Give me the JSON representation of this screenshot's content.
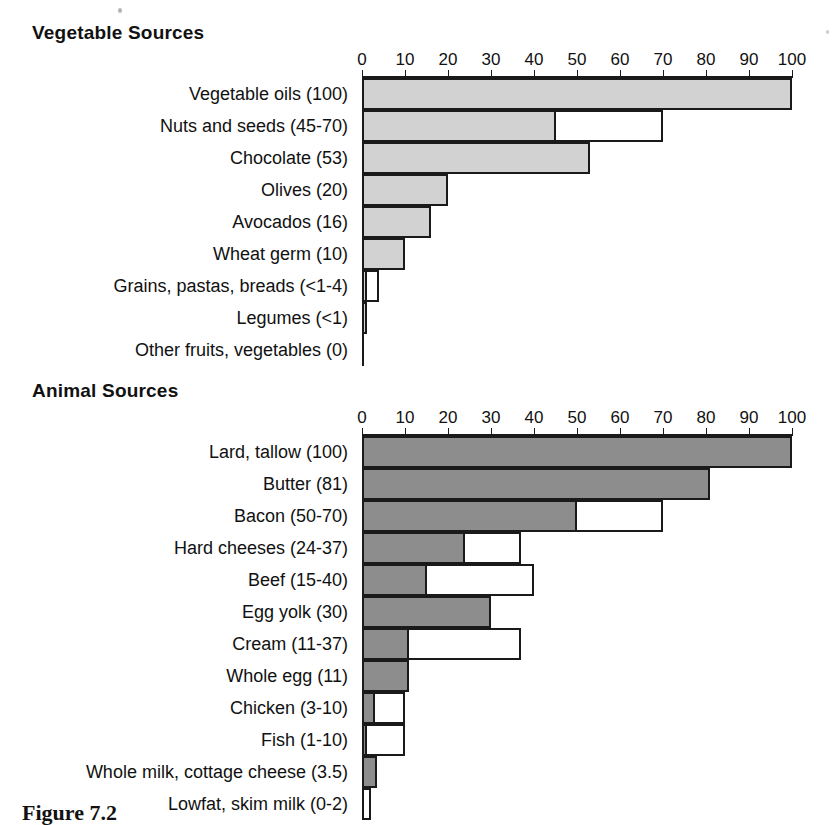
{
  "figure": {
    "caption": "Figure 7.2"
  },
  "chart_data": [
    {
      "type": "bar",
      "title": "Vegetable Sources",
      "orientation": "horizontal",
      "xlabel": "",
      "ylabel": "",
      "xlim": [
        0,
        100
      ],
      "xticks": [
        0,
        10,
        20,
        30,
        40,
        50,
        60,
        70,
        80,
        90,
        100
      ],
      "grid": false,
      "legend": "none",
      "fill_color": "#d2d2d2",
      "range_color": "#ffffff",
      "categories": [
        "Vegetable oils (100)",
        "Nuts and seeds (45-70)",
        "Chocolate (53)",
        "Olives (20)",
        "Avocados (16)",
        "Wheat germ (10)",
        "Grains, pastas, breads (<1-4)",
        "Legumes (<1)",
        "Other fruits, vegetables (0)"
      ],
      "values": [
        100,
        45,
        53,
        20,
        16,
        10,
        1,
        1,
        0
      ],
      "range_high": [
        100,
        70,
        53,
        20,
        16,
        10,
        4,
        1,
        0
      ]
    },
    {
      "type": "bar",
      "title": "Animal Sources",
      "orientation": "horizontal",
      "xlabel": "",
      "ylabel": "",
      "xlim": [
        0,
        100
      ],
      "xticks": [
        0,
        10,
        20,
        30,
        40,
        50,
        60,
        70,
        80,
        90,
        100
      ],
      "grid": false,
      "legend": "none",
      "fill_color": "#8d8d8d",
      "range_color": "#ffffff",
      "categories": [
        "Lard, tallow (100)",
        "Butter (81)",
        "Bacon (50-70)",
        "Hard cheeses (24-37)",
        "Beef (15-40)",
        "Egg yolk (30)",
        "Cream (11-37)",
        "Whole egg (11)",
        "Chicken (3-10)",
        "Fish (1-10)",
        "Whole milk, cottage cheese (3.5)",
        "Lowfat, skim milk (0-2)"
      ],
      "values": [
        100,
        81,
        50,
        24,
        15,
        30,
        11,
        11,
        3,
        1,
        3.5,
        0
      ],
      "range_high": [
        100,
        81,
        70,
        37,
        40,
        30,
        37,
        11,
        10,
        10,
        3.5,
        2
      ]
    }
  ]
}
